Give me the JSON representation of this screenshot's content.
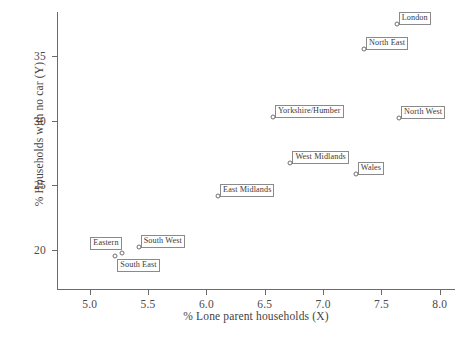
{
  "chart_data": {
    "type": "scatter",
    "title": "",
    "xlabel": "% Lone parent households (X)",
    "ylabel": "% Households with no car (Y)",
    "xlim": [
      4.72,
      8.13
    ],
    "ylim": [
      16.9,
      38.4
    ],
    "xticks": [
      "5.0",
      "5.5",
      "6.0",
      "6.5",
      "7.0",
      "7.5",
      "8.0"
    ],
    "xtickvalues": [
      5.0,
      5.5,
      6.0,
      6.5,
      7.0,
      7.5,
      8.0
    ],
    "yticks": [
      "20",
      "25",
      "30",
      "35"
    ],
    "ytickvalues": [
      20,
      25,
      30,
      35
    ],
    "grid": false,
    "legend": "none",
    "marker": "open-circle",
    "points": [
      {
        "label": "London",
        "x": 7.63,
        "y": 37.5,
        "label_pos": "right"
      },
      {
        "label": "North East",
        "x": 7.35,
        "y": 35.5,
        "label_pos": "right"
      },
      {
        "label": "North West",
        "x": 7.65,
        "y": 30.2,
        "label_pos": "right"
      },
      {
        "label": "Yorkshire/Humber",
        "x": 6.57,
        "y": 30.3,
        "label_pos": "right"
      },
      {
        "label": "West Midlands",
        "x": 6.72,
        "y": 26.7,
        "label_pos": "right"
      },
      {
        "label": "Wales",
        "x": 7.28,
        "y": 25.9,
        "label_pos": "right"
      },
      {
        "label": "East Midlands",
        "x": 6.1,
        "y": 24.2,
        "label_pos": "right"
      },
      {
        "label": "South West",
        "x": 5.42,
        "y": 20.2,
        "label_pos": "right"
      },
      {
        "label": "Eastern",
        "x": 5.28,
        "y": 19.8,
        "label_pos": "upper-left"
      },
      {
        "label": "South East",
        "x": 5.22,
        "y": 19.5,
        "label_pos": "lower-right"
      }
    ],
    "colors": {
      "axis": "#6b6b6b",
      "marker_edge": "#6f6f6f",
      "label_border": "#8a8a8a",
      "text": "#3a3a3a",
      "background": "#ffffff"
    }
  }
}
